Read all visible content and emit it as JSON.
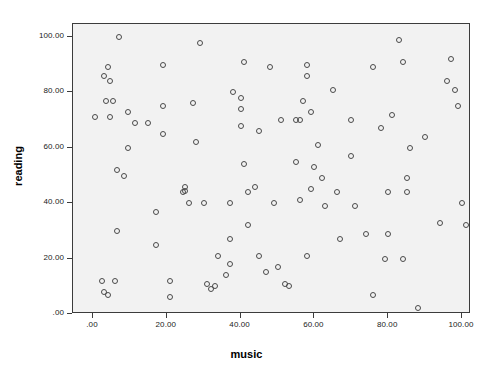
{
  "chart_data": {
    "type": "scatter",
    "title": "",
    "xlabel": "music",
    "ylabel": "reading",
    "xlim": [
      -5,
      107
    ],
    "ylim": [
      -5,
      105
    ],
    "grid": false,
    "legend": null,
    "marker": "open-circle",
    "x_ticks": [
      {
        "value": 0,
        "label": ".00"
      },
      {
        "value": 20,
        "label": "20.00"
      },
      {
        "value": 40,
        "label": "40.00"
      },
      {
        "value": 60,
        "label": "60.00"
      },
      {
        "value": 80,
        "label": "80.00"
      },
      {
        "value": 100,
        "label": "100.00"
      }
    ],
    "y_ticks": [
      {
        "value": 0,
        "label": ".00"
      },
      {
        "value": 20,
        "label": "20.00"
      },
      {
        "value": 40,
        "label": "40.00"
      },
      {
        "value": 60,
        "label": "60.00"
      },
      {
        "value": 80,
        "label": "80.00"
      },
      {
        "value": 100,
        "label": "100.00"
      }
    ],
    "points": [
      {
        "x": 7,
        "y": 100
      },
      {
        "x": 4,
        "y": 89
      },
      {
        "x": 3,
        "y": 86
      },
      {
        "x": 4.5,
        "y": 84
      },
      {
        "x": 3.5,
        "y": 77
      },
      {
        "x": 5.5,
        "y": 77
      },
      {
        "x": 0.5,
        "y": 71
      },
      {
        "x": 4.5,
        "y": 71
      },
      {
        "x": 9.5,
        "y": 73
      },
      {
        "x": 11.5,
        "y": 69
      },
      {
        "x": 9.5,
        "y": 60
      },
      {
        "x": 6.5,
        "y": 52
      },
      {
        "x": 8.5,
        "y": 50
      },
      {
        "x": 6.5,
        "y": 30
      },
      {
        "x": 2.5,
        "y": 12
      },
      {
        "x": 6,
        "y": 12
      },
      {
        "x": 3,
        "y": 8
      },
      {
        "x": 4,
        "y": 7
      },
      {
        "x": 19,
        "y": 90
      },
      {
        "x": 19,
        "y": 75
      },
      {
        "x": 15,
        "y": 69
      },
      {
        "x": 19,
        "y": 65
      },
      {
        "x": 17,
        "y": 37
      },
      {
        "x": 17,
        "y": 25
      },
      {
        "x": 21,
        "y": 12
      },
      {
        "x": 21,
        "y": 6
      },
      {
        "x": 29,
        "y": 98
      },
      {
        "x": 27,
        "y": 76
      },
      {
        "x": 28,
        "y": 62
      },
      {
        "x": 25,
        "y": 46
      },
      {
        "x": 24.5,
        "y": 44
      },
      {
        "x": 25,
        "y": 44.5
      },
      {
        "x": 26,
        "y": 40
      },
      {
        "x": 30,
        "y": 40
      },
      {
        "x": 31,
        "y": 11
      },
      {
        "x": 32,
        "y": 9
      },
      {
        "x": 34,
        "y": 21
      },
      {
        "x": 33,
        "y": 10
      },
      {
        "x": 36,
        "y": 14
      },
      {
        "x": 37,
        "y": 27
      },
      {
        "x": 37,
        "y": 18
      },
      {
        "x": 37,
        "y": 40
      },
      {
        "x": 41,
        "y": 91
      },
      {
        "x": 38,
        "y": 80
      },
      {
        "x": 40,
        "y": 78
      },
      {
        "x": 40,
        "y": 74
      },
      {
        "x": 40,
        "y": 68
      },
      {
        "x": 42,
        "y": 44
      },
      {
        "x": 42,
        "y": 32
      },
      {
        "x": 41,
        "y": 54
      },
      {
        "x": 45,
        "y": 66
      },
      {
        "x": 44,
        "y": 46
      },
      {
        "x": 45,
        "y": 21
      },
      {
        "x": 47,
        "y": 15
      },
      {
        "x": 48,
        "y": 89
      },
      {
        "x": 51,
        "y": 70
      },
      {
        "x": 49,
        "y": 40
      },
      {
        "x": 50,
        "y": 17
      },
      {
        "x": 52,
        "y": 11
      },
      {
        "x": 53,
        "y": 10
      },
      {
        "x": 55,
        "y": 55
      },
      {
        "x": 55,
        "y": 70
      },
      {
        "x": 56,
        "y": 70
      },
      {
        "x": 57,
        "y": 77
      },
      {
        "x": 58,
        "y": 86
      },
      {
        "x": 58,
        "y": 90
      },
      {
        "x": 59,
        "y": 73
      },
      {
        "x": 56,
        "y": 41
      },
      {
        "x": 58,
        "y": 21
      },
      {
        "x": 59,
        "y": 45
      },
      {
        "x": 60,
        "y": 53
      },
      {
        "x": 61,
        "y": 61
      },
      {
        "x": 62,
        "y": 49
      },
      {
        "x": 63,
        "y": 39
      },
      {
        "x": 65,
        "y": 81
      },
      {
        "x": 66,
        "y": 44
      },
      {
        "x": 67,
        "y": 27
      },
      {
        "x": 70,
        "y": 70
      },
      {
        "x": 70,
        "y": 57
      },
      {
        "x": 71,
        "y": 39
      },
      {
        "x": 74,
        "y": 29
      },
      {
        "x": 76,
        "y": 89
      },
      {
        "x": 76,
        "y": 7
      },
      {
        "x": 78,
        "y": 67
      },
      {
        "x": 79,
        "y": 20
      },
      {
        "x": 80,
        "y": 44
      },
      {
        "x": 80,
        "y": 29
      },
      {
        "x": 81,
        "y": 72
      },
      {
        "x": 83,
        "y": 99
      },
      {
        "x": 84,
        "y": 91
      },
      {
        "x": 84,
        "y": 20
      },
      {
        "x": 85,
        "y": 49
      },
      {
        "x": 85,
        "y": 44
      },
      {
        "x": 86,
        "y": 60
      },
      {
        "x": 88,
        "y": 2
      },
      {
        "x": 90,
        "y": 64
      },
      {
        "x": 94,
        "y": 33
      },
      {
        "x": 96,
        "y": 84
      },
      {
        "x": 97,
        "y": 92
      },
      {
        "x": 98,
        "y": 81
      },
      {
        "x": 99,
        "y": 75
      },
      {
        "x": 100,
        "y": 40
      },
      {
        "x": 101,
        "y": 32
      }
    ]
  }
}
